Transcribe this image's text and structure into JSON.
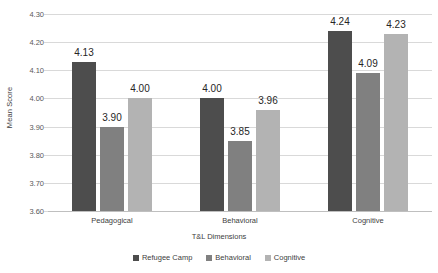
{
  "chart_data": {
    "type": "bar",
    "title": "",
    "xlabel": "T&L Dimensions",
    "ylabel": "Mean Score",
    "ylim": [
      3.6,
      4.3
    ],
    "ytick_step": 0.1,
    "ytick_labels": [
      "4.30",
      "4.20",
      "4.10",
      "4.00",
      "3.90",
      "3.80",
      "3.70",
      "3.60"
    ],
    "ytick_values": [
      4.3,
      4.2,
      4.1,
      4.0,
      3.9,
      3.8,
      3.7,
      3.6
    ],
    "grid": true,
    "legend_position": "bottom",
    "categories": [
      "Pedagogical",
      "Behavioral",
      "Cognitive"
    ],
    "series": [
      {
        "name": "Refugee Camp",
        "color": "#4d4d4d",
        "values": [
          4.13,
          4.0,
          4.24
        ],
        "labels": [
          "4.13",
          "4.00",
          "4.24"
        ]
      },
      {
        "name": "Behavioral",
        "color": "#808080",
        "values": [
          3.9,
          3.85,
          4.09
        ],
        "labels": [
          "3.90",
          "3.85",
          "4.09"
        ]
      },
      {
        "name": "Cognitive",
        "color": "#b3b3b3",
        "values": [
          4.0,
          3.96,
          4.23
        ],
        "labels": [
          "4.00",
          "3.96",
          "4.23"
        ]
      }
    ]
  },
  "axis": {
    "y_title": "Mean Score",
    "x_title": "T&L Dimensions"
  },
  "colors": {
    "gridline": "#d9d9d9",
    "baseline": "#bfbfbf",
    "tick_text": "#595959",
    "label_text": "#262626",
    "background": "#ffffff"
  }
}
